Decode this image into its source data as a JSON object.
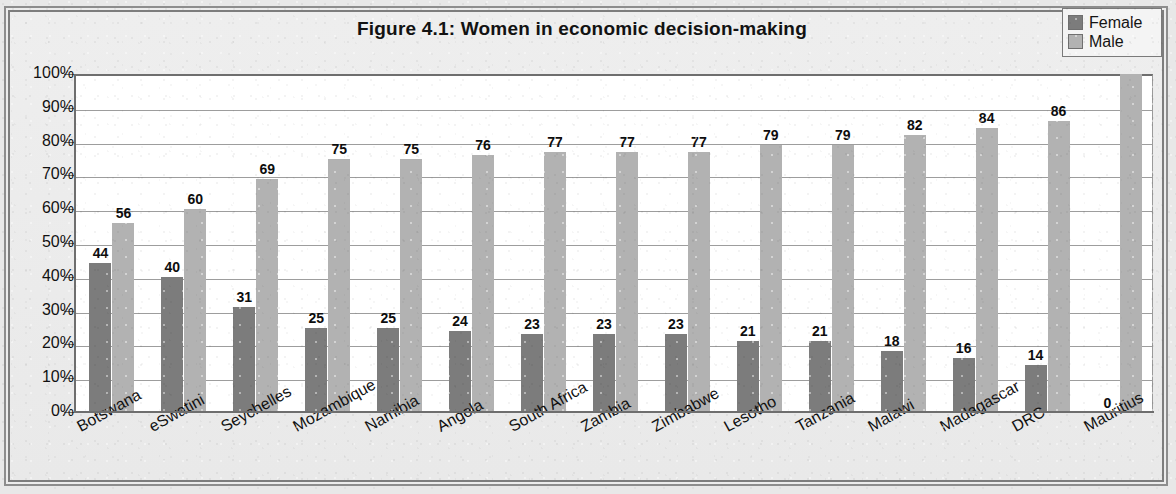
{
  "chart_data": {
    "type": "bar",
    "title": "Figure 4.1: Women in economic decision-making",
    "xlabel": "",
    "ylabel": "",
    "ylim": [
      0,
      100
    ],
    "grid": true,
    "legend_position": "top-right",
    "categories": [
      "Botswana",
      "eSwatini",
      "Seychelles",
      "Mozambique",
      "Namibia",
      "Angola",
      "South Africa",
      "Zambia",
      "Zimbabwe",
      "Lesotho",
      "Tanzania",
      "Malawi",
      "Madagascar",
      "DRC",
      "Mauritius"
    ],
    "series": [
      {
        "name": "Female",
        "color": "#7c7c7c",
        "values": [
          44,
          40,
          31,
          25,
          25,
          24,
          23,
          23,
          23,
          21,
          21,
          18,
          16,
          14,
          0
        ]
      },
      {
        "name": "Male",
        "color": "#b2b2b2",
        "values": [
          56,
          60,
          69,
          75,
          75,
          76,
          77,
          77,
          77,
          79,
          79,
          82,
          84,
          86,
          100
        ]
      }
    ],
    "ytick_labels": [
      "100%",
      "90%",
      "80%",
      "70%",
      "60%",
      "50%",
      "40%",
      "30%",
      "20%",
      "10%",
      "0%"
    ],
    "ytick_values": [
      100,
      90,
      80,
      70,
      60,
      50,
      40,
      30,
      20,
      10,
      0
    ]
  },
  "legend": {
    "items": [
      {
        "label": "Female",
        "color": "#7c7c7c"
      },
      {
        "label": "Male",
        "color": "#b2b2b2"
      }
    ]
  }
}
